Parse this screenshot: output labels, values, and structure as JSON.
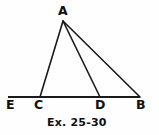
{
  "figure": {
    "caption": "Ex. 25-30",
    "background_color": "#fefefe",
    "stroke_color": "#1a1a1a",
    "text_color": "#101010",
    "width": 159,
    "height": 135
  },
  "labels": {
    "apex": "A",
    "baseline_left_end": "E",
    "baseline_point_c": "C",
    "baseline_point_d": "D",
    "baseline_right_end": "B"
  },
  "chart_data": {
    "type": "diagram",
    "title": "Ex. 25-30",
    "points": [
      {
        "name": "A",
        "x": 63,
        "y": 21,
        "label_dx": -5,
        "label_dy": -16
      },
      {
        "name": "E",
        "x": 8,
        "y": 97,
        "label_dx": -2,
        "label_dy": 2
      },
      {
        "name": "C",
        "x": 40,
        "y": 97,
        "label_dx": -6,
        "label_dy": 2
      },
      {
        "name": "D",
        "x": 100,
        "y": 97,
        "label_dx": -5,
        "label_dy": 2
      },
      {
        "name": "B",
        "x": 140,
        "y": 97,
        "label_dx": -4,
        "label_dy": 2
      }
    ],
    "segments": [
      {
        "name": "baseline-EB",
        "from": "E",
        "to": "B",
        "width": 2.0
      },
      {
        "name": "side-AC",
        "from": "A",
        "to": "C",
        "width": 1.6
      },
      {
        "name": "cevian-AD",
        "from": "A",
        "to": "D",
        "width": 1.6
      },
      {
        "name": "side-AB",
        "from": "A",
        "to": "B",
        "width": 1.6
      }
    ],
    "xlabel": "",
    "ylabel": "",
    "grid": false,
    "legend": null
  }
}
